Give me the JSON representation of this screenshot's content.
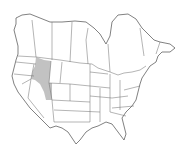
{
  "map": {
    "type": "species range map",
    "region": "North America (United States and southern Canada)",
    "background_color": "#ffffff",
    "land_color": "#ffffff",
    "border_color": "#6a6a6a",
    "range": {
      "color": "#c2c2c2",
      "areas": [
        "Idaho",
        "Western Montana",
        "Western Wyoming",
        "Northeastern Utah"
      ]
    }
  }
}
